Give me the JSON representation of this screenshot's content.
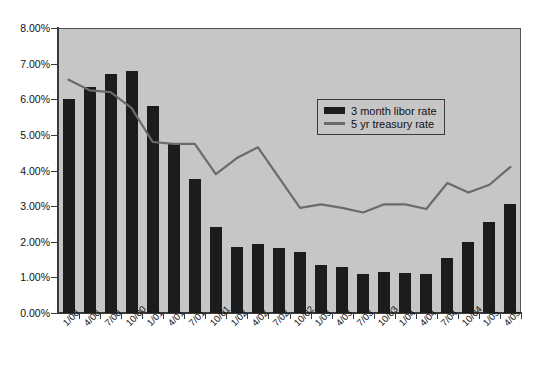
{
  "chart_data": {
    "type": "bar",
    "title": "",
    "subtitle": "",
    "xlabel": "",
    "ylabel": "",
    "ylim": [
      0,
      8
    ],
    "ytick_values": [
      0,
      1,
      2,
      3,
      4,
      5,
      6,
      7,
      8
    ],
    "ytick_labels": [
      "0.00%",
      "1.00%",
      "2.00%",
      "3.00%",
      "4.00%",
      "5.00%",
      "6.00%",
      "7.00%",
      "8.00%"
    ],
    "grid": false,
    "legend_position": "upper-center-right",
    "categories": [
      "1/00",
      "4/00",
      "7/00",
      "10/00",
      "1/01",
      "4/01",
      "7/01",
      "10/01",
      "1/02",
      "4/02",
      "7/02",
      "10/02",
      "1/03",
      "4/03",
      "7/03",
      "10/03",
      "1/04",
      "4/04",
      "7/04",
      "10/04",
      "1/05",
      "4/05"
    ],
    "series": [
      {
        "name": "3 month libor rate",
        "type": "bar",
        "color": "#1c1c1c",
        "values": [
          6.02,
          6.35,
          6.72,
          6.78,
          5.8,
          4.75,
          3.75,
          2.42,
          1.85,
          1.95,
          1.82,
          1.72,
          1.35,
          1.28,
          1.1,
          1.15,
          1.12,
          1.1,
          1.55,
          1.98,
          2.55,
          3.05
        ]
      },
      {
        "name": "5 yr treasury rate",
        "type": "line",
        "color": "#6b6b6b",
        "values": [
          6.55,
          6.25,
          6.2,
          5.75,
          4.8,
          4.75,
          4.75,
          3.9,
          4.35,
          4.65,
          3.8,
          2.95,
          3.05,
          2.95,
          2.82,
          3.05,
          3.05,
          2.92,
          3.65,
          3.38,
          3.6,
          4.1
        ]
      }
    ]
  },
  "legend": {
    "items": [
      {
        "label": "3 month libor rate",
        "marker": "bar-swatch"
      },
      {
        "label": "5 yr treasury rate",
        "marker": "line-swatch"
      }
    ]
  }
}
